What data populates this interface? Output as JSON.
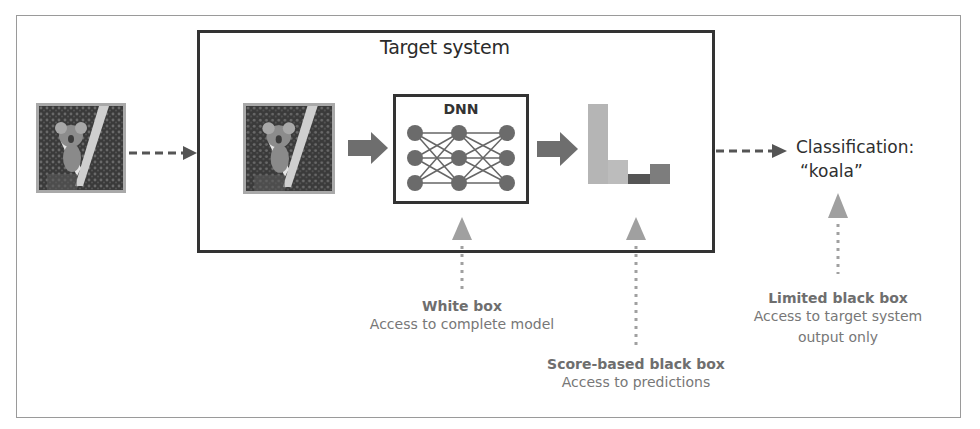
{
  "diagram": {
    "target_system": {
      "title": "Target system"
    },
    "dnn": {
      "title": "DNN",
      "layers": [
        3,
        3,
        3
      ]
    },
    "input_image": {
      "subject": "koala-photo"
    },
    "predictions_chart": {
      "bars": [
        {
          "height": 80,
          "color": "#b5b5b5"
        },
        {
          "height": 24,
          "color": "#bcbcbc"
        },
        {
          "height": 10,
          "color": "#555555"
        },
        {
          "height": 20,
          "color": "#7d7d7d"
        }
      ]
    },
    "output": {
      "line1": "Classification:",
      "line2": "“koala”"
    },
    "access_levels": [
      {
        "title": "White box",
        "description": "Access to complete model"
      },
      {
        "title": "Score-based black box",
        "description": "Access to predictions"
      },
      {
        "title": "Limited black box",
        "description_line1": "Access to target system",
        "description_line2": "output only"
      }
    ],
    "colors": {
      "frame": "#9a9a9a",
      "box_border": "#333333",
      "node": "#6b6b6b",
      "arrow_block": "#6e6e6e",
      "access_arrow": "#a0a0a0"
    }
  }
}
